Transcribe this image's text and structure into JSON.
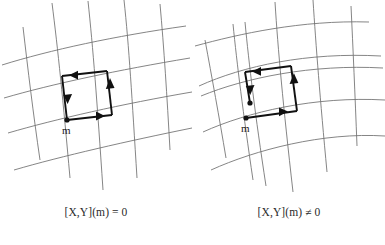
{
  "figure": {
    "background_color": "#ffffff",
    "grid_color": "#6f6f6f",
    "loop_color": "#111111",
    "text_color": "#2a2a2a"
  },
  "panels": [
    {
      "id": "flat-grid-panel",
      "position": "left",
      "point_label": "m",
      "caption": "[X,Y](m) = 0",
      "loop_closed": true,
      "description": "coordinate grid with closed square loop",
      "arrow_directions": [
        "left",
        "down",
        "right",
        "up"
      ],
      "node_count": 1
    },
    {
      "id": "curved-grid-panel",
      "position": "right",
      "point_label": "m",
      "caption": "[X,Y](m) ≠ 0",
      "loop_closed": false,
      "description": "curved coordinate grid with open loop showing a gap",
      "arrow_directions": [
        "left",
        "down",
        "right",
        "up"
      ],
      "node_count": 2
    }
  ],
  "icons": {
    "arrow_left": "arrow-left-icon",
    "arrow_right": "arrow-right-icon",
    "arrow_up": "arrow-up-icon",
    "arrow_down": "arrow-down-icon",
    "base_point": "base-point-dot-icon"
  }
}
